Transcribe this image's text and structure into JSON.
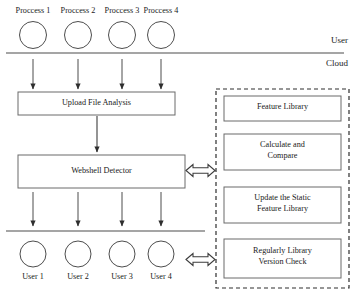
{
  "diagram": {
    "zones": [
      {
        "name": "user_zone",
        "label": "User"
      },
      {
        "name": "cloud_zone",
        "label": "Cloud"
      }
    ],
    "processes": [
      {
        "label": "Proccess 1"
      },
      {
        "label": "Proccess 2"
      },
      {
        "label": "Proccess 3"
      },
      {
        "label": "Proccess 4"
      }
    ],
    "users": [
      {
        "label": "User 1"
      },
      {
        "label": "User 2"
      },
      {
        "label": "User 3"
      },
      {
        "label": "User 4"
      }
    ],
    "pipeline": [
      {
        "name": "upload-file-analysis",
        "label": "Upload File Analysis"
      },
      {
        "name": "webshell-detector",
        "label": "Webshell Detector"
      }
    ],
    "library_panel": {
      "name": "feature-library-panel",
      "boxes": [
        {
          "name": "feature-library",
          "lines": [
            "Feature Library"
          ]
        },
        {
          "name": "calculate-and-compare",
          "lines": [
            "Calculate and",
            "Compare"
          ]
        },
        {
          "name": "update-static-feature-library",
          "lines": [
            "Update the Static",
            "Feature Library"
          ]
        },
        {
          "name": "regularly-library-version-check",
          "lines": [
            "Regularly Library",
            "Version Check"
          ]
        }
      ]
    },
    "colors": {
      "stroke": "#5a5a5a",
      "text": "#1a1a1a",
      "arrow": "#3d3d3d",
      "background": "#ffffff"
    }
  }
}
